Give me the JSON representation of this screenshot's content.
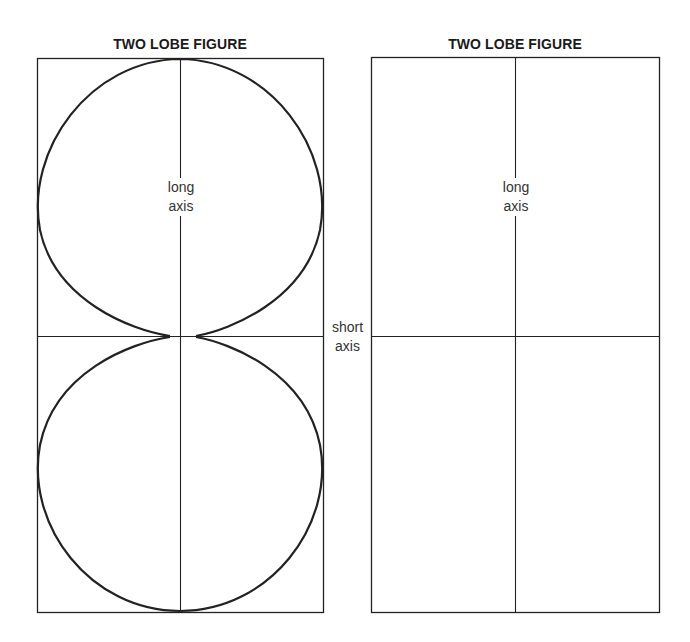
{
  "figures": [
    {
      "title": "TWO LOBE FIGURE",
      "variant": "with-lobes",
      "long_axis_label": [
        "long",
        "axis"
      ]
    },
    {
      "title": "TWO LOBE FIGURE",
      "variant": "empty-grid",
      "long_axis_label": [
        "long",
        "axis"
      ]
    }
  ],
  "short_axis_label": [
    "short",
    "axis"
  ],
  "colors": {
    "line": "#1a1a1a",
    "background": "#ffffff"
  }
}
